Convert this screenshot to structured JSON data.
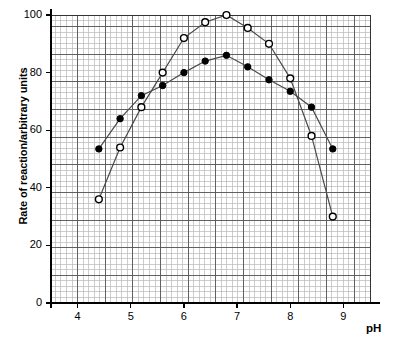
{
  "chart_data": {
    "type": "line",
    "title": "",
    "xlabel": "pH",
    "ylabel": "Rate of reaction/arbitrary units",
    "xlim": [
      3.5,
      9.5
    ],
    "ylim": [
      0,
      100
    ],
    "xticks": [
      4,
      5,
      6,
      7,
      8,
      9
    ],
    "xtick_labels": [
      "4",
      "5",
      "6",
      "7",
      "8",
      "9"
    ],
    "yticks": [
      0,
      20,
      40,
      60,
      80,
      100
    ],
    "ytick_labels": [
      "0",
      "20",
      "40",
      "60",
      "80",
      "100"
    ],
    "grid": true,
    "grid_major_color": "#555555",
    "grid_minor_color": "#b8b8b8",
    "legend": "none",
    "x": [
      4.4,
      4.8,
      5.2,
      5.6,
      6.0,
      6.4,
      6.8,
      7.2,
      7.6,
      8.0,
      8.4,
      8.8
    ],
    "series": [
      {
        "name": "open-circle-series",
        "marker": "open-circle",
        "marker_fill": "#ffffff",
        "marker_stroke": "#000000",
        "line_color": "#4a4a4a",
        "values": [
          36,
          54,
          68,
          80,
          92,
          97.5,
          100,
          95.5,
          90,
          78,
          58,
          30
        ]
      },
      {
        "name": "filled-circle-series",
        "marker": "filled-circle",
        "marker_fill": "#000000",
        "marker_stroke": "#000000",
        "line_color": "#4a4a4a",
        "values": [
          53.5,
          64,
          72,
          75.5,
          80,
          84,
          86,
          82,
          77.5,
          73.5,
          68,
          53.5
        ]
      }
    ]
  },
  "axes": {
    "y_title": "Rate of reaction/arbitrary units",
    "x_title": "pH"
  }
}
